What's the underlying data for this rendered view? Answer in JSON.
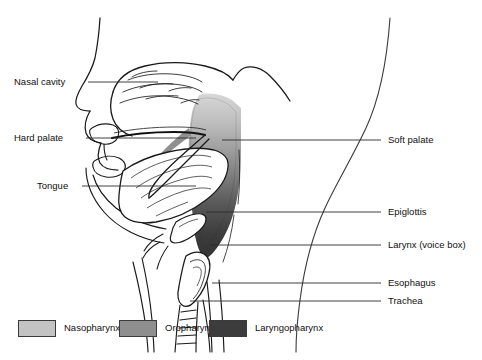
{
  "figure": {
    "background": "#ffffff",
    "line_color": "#1a1a1a"
  },
  "labels_left": [
    {
      "key": "nasal_cavity",
      "text": "Nasal cavity",
      "x": 14,
      "y": 77,
      "line_x1": 88,
      "line_x2": 158,
      "line_y": 82
    },
    {
      "key": "hard_palate",
      "text": "Hard palate",
      "x": 14,
      "y": 133,
      "line_x1": 86,
      "line_x2": 196,
      "line_y": 138
    },
    {
      "key": "tongue",
      "text": "Tongue",
      "x": 37,
      "y": 181,
      "line_x1": 82,
      "line_x2": 196,
      "line_y": 186
    }
  ],
  "labels_right": [
    {
      "key": "soft_palate",
      "text": "Soft palate",
      "x": 388,
      "y": 135,
      "line_x1": 222,
      "line_x2": 381,
      "line_y": 140
    },
    {
      "key": "epiglottis",
      "text": "Epiglottis",
      "x": 388,
      "y": 207,
      "line_x1": 206,
      "line_x2": 381,
      "line_y": 212
    },
    {
      "key": "larynx",
      "text": "Larynx (voice box)",
      "x": 388,
      "y": 240,
      "line_x1": 210,
      "line_x2": 381,
      "line_y": 245
    },
    {
      "key": "esophagus",
      "text": "Esophagus",
      "x": 388,
      "y": 278,
      "line_x1": 212,
      "line_x2": 381,
      "line_y": 283
    },
    {
      "key": "trachea",
      "text": "Trachea",
      "x": 388,
      "y": 296,
      "line_x1": 190,
      "line_x2": 381,
      "line_y": 301
    }
  ],
  "legend": {
    "items": [
      {
        "key": "nasopharynx",
        "label": "Nasopharynx",
        "color": "#c3c3c3",
        "x": 18,
        "swatch_border": "#3a3a3a"
      },
      {
        "key": "oropharynx",
        "label": "Oropharynx",
        "color": "#8e8e8e",
        "x": 119,
        "swatch_border": "#3a3a3a"
      },
      {
        "key": "laryngopharynx",
        "label": "Laryngopharynx",
        "color": "#3c3c3c",
        "x": 209,
        "swatch_border": "#3a3a3a"
      }
    ]
  },
  "chart_data": {
    "type": "diagram",
    "regions": [
      {
        "name": "Nasopharynx",
        "shade": "#c3c3c3",
        "position": "upper pharynx behind nasal cavity"
      },
      {
        "name": "Oropharynx",
        "shade": "#8e8e8e",
        "position": "middle pharynx behind oral cavity"
      },
      {
        "name": "Laryngopharynx",
        "shade": "#3c3c3c",
        "position": "lower pharynx above larynx and esophagus"
      }
    ],
    "annotations": [
      "Nasal cavity",
      "Hard palate",
      "Tongue",
      "Soft palate",
      "Epiglottis",
      "Larynx (voice box)",
      "Esophagus",
      "Trachea"
    ]
  }
}
